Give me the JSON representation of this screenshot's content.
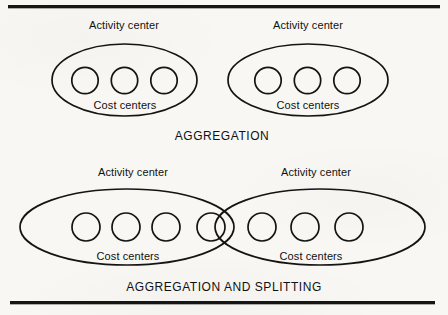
{
  "figure": {
    "background_color": "#f8f7f3",
    "ink_color": "#111111",
    "rules": {
      "top_name": "top-rule",
      "bottom_name": "bottom-rule"
    },
    "panels": [
      {
        "id": "aggregation",
        "caption": "AGGREGATION",
        "groups": [
          {
            "id": "top-left-activity-center",
            "activity_label": "Activity center",
            "cost_label": "Cost centers",
            "cost_center_count": 3
          },
          {
            "id": "top-right-activity-center",
            "activity_label": "Activity center",
            "cost_label": "Cost centers",
            "cost_center_count": 3
          }
        ]
      },
      {
        "id": "aggregation-and-splitting",
        "caption": "AGGREGATION AND SPLITTING",
        "groups": [
          {
            "id": "bottom-left-activity-center",
            "activity_label": "Activity center",
            "cost_label": "Cost centers",
            "cost_center_count": 4
          },
          {
            "id": "bottom-right-activity-center",
            "activity_label": "Activity center",
            "cost_label": "Cost centers",
            "cost_center_count": 4
          }
        ],
        "shared_cost_center": true
      }
    ]
  },
  "labels": {
    "top_left_activity": "Activity center",
    "top_right_activity": "Activity center",
    "top_left_cost": "Cost centers",
    "top_right_cost": "Cost centers",
    "top_caption": "AGGREGATION",
    "bottom_left_activity": "Activity center",
    "bottom_right_activity": "Activity center",
    "bottom_left_cost": "Cost centers",
    "bottom_right_cost": "Cost centers",
    "bottom_caption": "AGGREGATION AND SPLITTING"
  }
}
